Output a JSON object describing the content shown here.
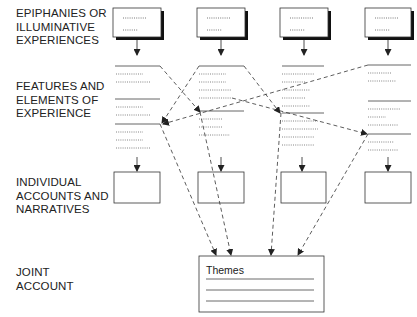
{
  "diagram": {
    "row_labels": {
      "epiphanies": "EPIPHANIES OR\nILLUMINATIVE\nEXPERIENCES",
      "features": "FEATURES AND\nELEMENTS OF\nEXPERIENCE",
      "individual": "INDIVIDUAL\nACCOUNTS AND\nNARRATIVES",
      "joint": "JOINT\nACCOUNT"
    },
    "columns": 4,
    "joint_box": {
      "title": "Themes",
      "line_count": 3
    },
    "colors": {
      "stroke": "#444444",
      "shadow": "#111111",
      "text": "#222222"
    }
  }
}
